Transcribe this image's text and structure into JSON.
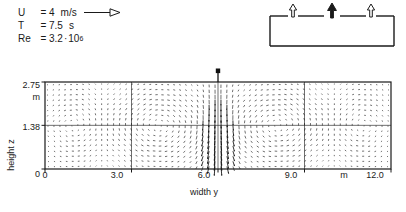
{
  "figure": {
    "type": "vector_field_plot"
  },
  "parameters": [
    {
      "symbol": "U",
      "equals": "=",
      "value": "4",
      "unit": "m/s",
      "has_arrow": true,
      "arrow_icon": "right-arrow-outline"
    },
    {
      "symbol": "T",
      "equals": "=",
      "value": "7.5",
      "unit": "s",
      "has_arrow": false,
      "arrow_icon": ""
    },
    {
      "symbol": "Re",
      "equals": "=",
      "value": "3.2",
      "unit": "",
      "mantissa_sep": "·",
      "base": "10",
      "exponent": "6",
      "has_arrow": false,
      "arrow_icon": ""
    }
  ],
  "inset": {
    "name": "enclosure-schematic",
    "outlet_arrows": [
      {
        "position": "left",
        "style": "outline",
        "direction": "up",
        "icon": "outlet-arrow-outline"
      },
      {
        "position": "right",
        "style": "outline",
        "direction": "up",
        "icon": "outlet-arrow-outline"
      }
    ],
    "inlet_arrows": [
      {
        "position": "center",
        "style": "filled",
        "direction": "up",
        "icon": "inlet-arrow-filled"
      }
    ]
  },
  "chart_data": {
    "type": "scatter",
    "title": "",
    "xlabel": "width y",
    "ylabel": "height z",
    "x_unit": "m",
    "y_unit": "m",
    "xlim": [
      0,
      12.0
    ],
    "ylim": [
      0,
      2.75
    ],
    "xticks": [
      0,
      3.0,
      6.0,
      9.0,
      12.0
    ],
    "xticklabels": [
      "0",
      "3.0",
      "6.0",
      "9.0",
      "12.0"
    ],
    "yticks": [
      0,
      1.38,
      2.75
    ],
    "yticklabels": [
      "0",
      "1.38",
      "2.75"
    ],
    "grid": true,
    "gridlines_x": [
      3.0,
      6.0,
      9.0
    ],
    "gridlines_y": [
      1.38
    ],
    "frame": true,
    "vector_field": {
      "glyph": "dashed-arrow",
      "grid_nx": 58,
      "grid_ny": 17,
      "jet": {
        "y": 6.0,
        "from_top": true,
        "width": 0.55,
        "strength": 1.85,
        "label_marker": "plume-source-marker"
      },
      "cells": [
        {
          "name": "left-corner-vortex",
          "cx": 1.05,
          "cy": 1.38,
          "rx": 1.05,
          "ry": 1.37,
          "sense": 1,
          "strength": 1.0
        },
        {
          "name": "left-main-vortex",
          "cx": 3.95,
          "cy": 1.38,
          "rx": 2.05,
          "ry": 1.37,
          "sense": -1,
          "strength": 1.25
        },
        {
          "name": "right-main-vortex",
          "cx": 8.05,
          "cy": 1.38,
          "rx": 2.05,
          "ry": 1.37,
          "sense": 1,
          "strength": 1.25
        },
        {
          "name": "right-corner-vortex",
          "cx": 10.95,
          "cy": 1.38,
          "rx": 1.05,
          "ry": 1.37,
          "sense": -1,
          "strength": 1.0
        }
      ]
    }
  }
}
